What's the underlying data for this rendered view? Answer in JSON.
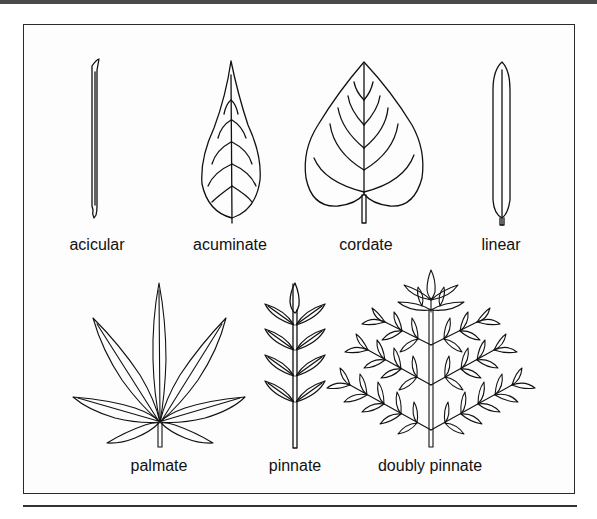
{
  "diagram": {
    "leaves": [
      {
        "id": "acicular",
        "label": "acicular"
      },
      {
        "id": "acuminate",
        "label": "acuminate"
      },
      {
        "id": "cordate",
        "label": "cordate"
      },
      {
        "id": "linear",
        "label": "linear"
      },
      {
        "id": "palmate",
        "label": "palmate"
      },
      {
        "id": "pinnate",
        "label": "pinnate"
      },
      {
        "id": "doubly-pinnate",
        "label": "doubly pinnate"
      }
    ],
    "colors": {
      "ink": "#111111",
      "background": "#ffffff",
      "frame": "#2a2a2a",
      "top_bar": "#4a4a4a"
    }
  }
}
